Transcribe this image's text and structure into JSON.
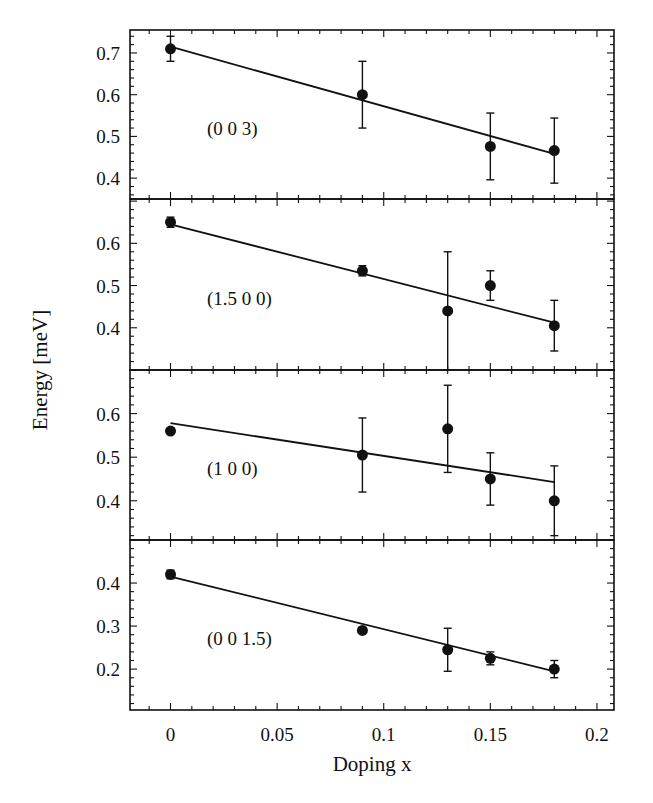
{
  "chart_data": {
    "type": "scatter",
    "layout": "4 vertically stacked panels sharing x-axis",
    "xlabel": "Doping x",
    "ylabel": "Energy [meV]",
    "xlim": [
      -0.019,
      0.208
    ],
    "xticks": [
      0,
      0.05,
      0.1,
      0.15,
      0.2
    ],
    "xtick_labels": [
      "0",
      "0.05",
      "0.1",
      "0.15",
      "0.2"
    ],
    "grid": false,
    "legend": null,
    "panels": [
      {
        "label": "(0 0 3)",
        "ylim": [
          0.35,
          0.755
        ],
        "yticks": [
          0.4,
          0.5,
          0.6,
          0.7
        ],
        "ytick_labels": [
          "0.4",
          "0.5",
          "0.6",
          "0.7"
        ],
        "points": [
          {
            "x": 0,
            "y": 0.71,
            "err": 0.03
          },
          {
            "x": 0.09,
            "y": 0.6,
            "err": 0.08
          },
          {
            "x": 0.15,
            "y": 0.476,
            "err": 0.08
          },
          {
            "x": 0.18,
            "y": 0.466,
            "err": 0.078
          }
        ],
        "fit": {
          "x": [
            0,
            0.18
          ],
          "y": [
            0.715,
            0.458
          ]
        }
      },
      {
        "label": "(1.5 0 0)",
        "ylim": [
          0.3,
          0.705
        ],
        "yticks": [
          0.4,
          0.5,
          0.6
        ],
        "ytick_labels": [
          "0.4",
          "0.5",
          "0.6"
        ],
        "points": [
          {
            "x": 0,
            "y": 0.65,
            "err": 0.012
          },
          {
            "x": 0.09,
            "y": 0.535,
            "err": 0.012
          },
          {
            "x": 0.13,
            "y": 0.44,
            "err": 0.14
          },
          {
            "x": 0.15,
            "y": 0.5,
            "err": 0.035
          },
          {
            "x": 0.18,
            "y": 0.405,
            "err": 0.06
          }
        ],
        "fit": {
          "x": [
            0,
            0.18
          ],
          "y": [
            0.645,
            0.412
          ]
        }
      },
      {
        "label": "(1 0 0)",
        "ylim": [
          0.31,
          0.7
        ],
        "yticks": [
          0.4,
          0.5,
          0.6
        ],
        "ytick_labels": [
          "0.4",
          "0.5",
          "0.6"
        ],
        "points": [
          {
            "x": 0,
            "y": 0.56,
            "err": 0.005
          },
          {
            "x": 0.09,
            "y": 0.505,
            "err": 0.085
          },
          {
            "x": 0.13,
            "y": 0.565,
            "err": 0.1
          },
          {
            "x": 0.15,
            "y": 0.45,
            "err": 0.06
          },
          {
            "x": 0.18,
            "y": 0.4,
            "err": 0.08
          }
        ],
        "fit": {
          "x": [
            0,
            0.18
          ],
          "y": [
            0.578,
            0.443
          ]
        }
      },
      {
        "label": "(0 0 1.5)",
        "ylim": [
          0.105,
          0.5
        ],
        "yticks": [
          0.2,
          0.3,
          0.4
        ],
        "ytick_labels": [
          "0.2",
          "0.3",
          "0.4"
        ],
        "points": [
          {
            "x": 0,
            "y": 0.42,
            "err": 0.01
          },
          {
            "x": 0.09,
            "y": 0.29,
            "err": 0.005
          },
          {
            "x": 0.13,
            "y": 0.245,
            "err": 0.05
          },
          {
            "x": 0.15,
            "y": 0.225,
            "err": 0.015
          },
          {
            "x": 0.18,
            "y": 0.2,
            "err": 0.02
          }
        ],
        "fit": {
          "x": [
            0,
            0.18
          ],
          "y": [
            0.415,
            0.195
          ]
        }
      }
    ]
  },
  "figure": {
    "xlabel": "Doping x",
    "ylabel": "Energy [meV]",
    "line_color": "#111111",
    "background": "#ffffff"
  }
}
